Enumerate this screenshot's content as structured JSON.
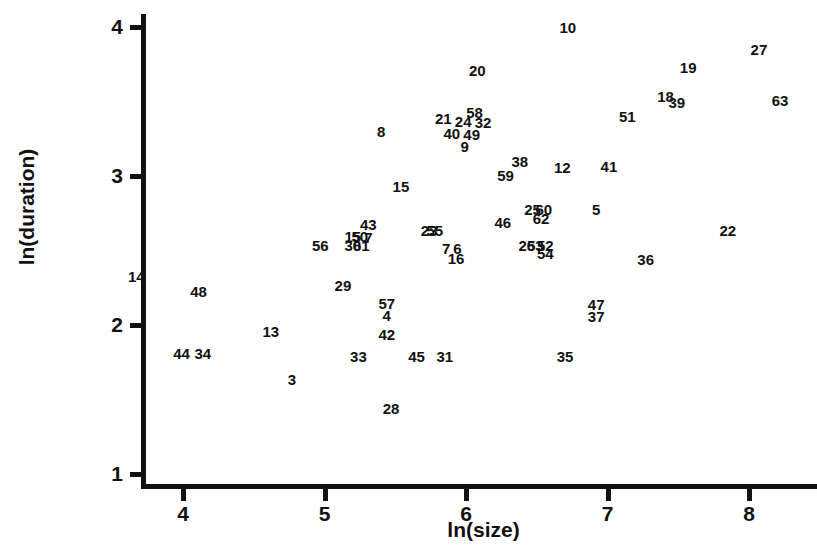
{
  "chart_data": {
    "type": "scatter",
    "title": "",
    "xlabel": "ln(size)",
    "ylabel": "ln(duration)",
    "xlim": [
      3.6,
      8.4
    ],
    "ylim": [
      0.9,
      4.1
    ],
    "xticks": [
      "4",
      "5",
      "6",
      "7",
      "8"
    ],
    "yticks": [
      "4",
      "3",
      "2",
      "1"
    ],
    "grid": false,
    "legend": "none",
    "marker_style": "case-number-labels",
    "points": [
      {
        "label": "10",
        "x": 6.72,
        "y": 4.0
      },
      {
        "label": "27",
        "x": 8.07,
        "y": 3.85
      },
      {
        "label": "20",
        "x": 6.08,
        "y": 3.71
      },
      {
        "label": "19",
        "x": 7.57,
        "y": 3.73
      },
      {
        "label": "18",
        "x": 7.41,
        "y": 3.54
      },
      {
        "label": "39",
        "x": 7.49,
        "y": 3.5
      },
      {
        "label": "63",
        "x": 8.22,
        "y": 3.51
      },
      {
        "label": "58",
        "x": 6.06,
        "y": 3.43
      },
      {
        "label": "21",
        "x": 5.84,
        "y": 3.39
      },
      {
        "label": "24",
        "x": 5.98,
        "y": 3.37
      },
      {
        "label": "32",
        "x": 6.12,
        "y": 3.36
      },
      {
        "label": "51",
        "x": 7.14,
        "y": 3.4
      },
      {
        "label": "8",
        "x": 5.4,
        "y": 3.3
      },
      {
        "label": "40",
        "x": 5.9,
        "y": 3.29
      },
      {
        "label": "49",
        "x": 6.04,
        "y": 3.28
      },
      {
        "label": "9",
        "x": 5.99,
        "y": 3.2
      },
      {
        "label": "38",
        "x": 6.38,
        "y": 3.1
      },
      {
        "label": "12",
        "x": 6.68,
        "y": 3.06
      },
      {
        "label": "41",
        "x": 7.01,
        "y": 3.07
      },
      {
        "label": "59",
        "x": 6.28,
        "y": 3.01
      },
      {
        "label": "15",
        "x": 5.54,
        "y": 2.93
      },
      {
        "label": "25",
        "x": 6.47,
        "y": 2.78
      },
      {
        "label": "60",
        "x": 6.55,
        "y": 2.78
      },
      {
        "label": "5",
        "x": 6.92,
        "y": 2.78
      },
      {
        "label": "62",
        "x": 6.53,
        "y": 2.72
      },
      {
        "label": "46",
        "x": 6.26,
        "y": 2.69
      },
      {
        "label": "43",
        "x": 5.31,
        "y": 2.68
      },
      {
        "label": "22",
        "x": 7.85,
        "y": 2.64
      },
      {
        "label": "23",
        "x": 5.74,
        "y": 2.64
      },
      {
        "label": "55",
        "x": 5.78,
        "y": 2.64
      },
      {
        "label": "15b",
        "x": 5.2,
        "y": 2.6
      },
      {
        "label": "50",
        "x": 5.25,
        "y": 2.6
      },
      {
        "label": "7",
        "x": 5.31,
        "y": 2.59
      },
      {
        "label": "56",
        "x": 4.97,
        "y": 2.54
      },
      {
        "label": "30",
        "x": 5.2,
        "y": 2.54
      },
      {
        "label": "61",
        "x": 5.26,
        "y": 2.54
      },
      {
        "label": "26",
        "x": 6.43,
        "y": 2.54
      },
      {
        "label": "53",
        "x": 6.49,
        "y": 2.54
      },
      {
        "label": "52",
        "x": 6.56,
        "y": 2.54
      },
      {
        "label": "7b",
        "x": 5.86,
        "y": 2.52
      },
      {
        "label": "6",
        "x": 5.94,
        "y": 2.52
      },
      {
        "label": "54",
        "x": 6.56,
        "y": 2.48
      },
      {
        "label": "16",
        "x": 5.93,
        "y": 2.45
      },
      {
        "label": "36",
        "x": 7.27,
        "y": 2.44
      },
      {
        "label": "14",
        "x": 3.67,
        "y": 2.33
      },
      {
        "label": "48",
        "x": 4.11,
        "y": 2.23
      },
      {
        "label": "29",
        "x": 5.13,
        "y": 2.27
      },
      {
        "label": "57",
        "x": 5.44,
        "y": 2.15
      },
      {
        "label": "47",
        "x": 6.92,
        "y": 2.14
      },
      {
        "label": "4",
        "x": 5.44,
        "y": 2.07
      },
      {
        "label": "37",
        "x": 6.92,
        "y": 2.06
      },
      {
        "label": "13",
        "x": 4.62,
        "y": 1.96
      },
      {
        "label": "42",
        "x": 5.44,
        "y": 1.94
      },
      {
        "label": "44",
        "x": 3.99,
        "y": 1.81
      },
      {
        "label": "34",
        "x": 4.14,
        "y": 1.81
      },
      {
        "label": "33",
        "x": 5.24,
        "y": 1.79
      },
      {
        "label": "45",
        "x": 5.65,
        "y": 1.79
      },
      {
        "label": "31",
        "x": 5.85,
        "y": 1.79
      },
      {
        "label": "35",
        "x": 6.7,
        "y": 1.79
      },
      {
        "label": "3",
        "x": 4.77,
        "y": 1.64
      },
      {
        "label": "28",
        "x": 5.47,
        "y": 1.44
      }
    ]
  },
  "axes": {
    "x_title": "ln(size)",
    "y_title": "ln(duration)",
    "x_tick_labels": [
      "4",
      "5",
      "6",
      "7",
      "8"
    ],
    "y_tick_labels": [
      "4",
      "3",
      "2",
      "1"
    ]
  }
}
